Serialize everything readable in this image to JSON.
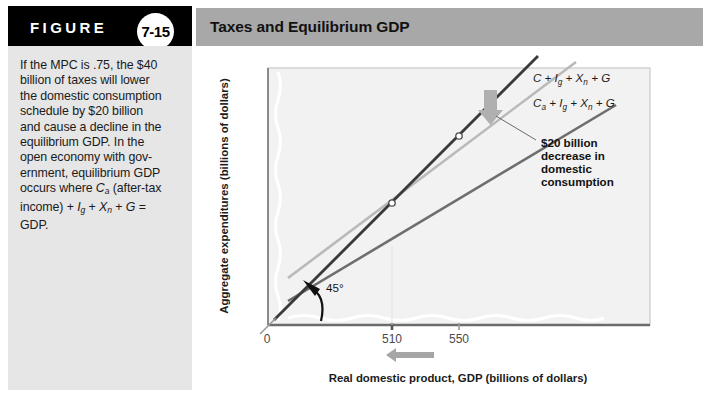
{
  "figure": {
    "word": "FIGURE",
    "number": "7-15",
    "title": "Taxes and Equilibrium GDP",
    "caption_lines": [
      "If the MPC is .75, the $40",
      "billion of taxes will lower",
      "the domestic consumption",
      "schedule by $20 billion",
      "and cause a decline in the",
      "equilibrium GDP. In the",
      "open economy with gov-",
      "ernment, equilibrium GDP",
      "occurs where Ca (after-tax",
      "income) + Ig + Xn + G =",
      "GDP."
    ]
  },
  "chart_data": {
    "type": "line",
    "title": "Taxes and Equilibrium GDP",
    "xlabel": "Real domestic product, GDP (billions of dollars)",
    "ylabel": "Aggregate expenditures (billions of dollars)",
    "xticks": [
      "0",
      "510",
      "550"
    ],
    "xtick_values": [
      0,
      510,
      550
    ],
    "xlim": [
      0,
      700
    ],
    "ylim": [
      0,
      700
    ],
    "grid": false,
    "legend_position": "inline-right",
    "series": [
      {
        "name": "45-degree-line",
        "label": "45°",
        "color": "#3d3d3d",
        "kind": "reference",
        "points": [
          [
            60,
            60
          ],
          [
            620,
            620
          ]
        ]
      },
      {
        "name": "C + Ig + Xn + G",
        "label_parts": [
          "C",
          " + ",
          "I",
          "g",
          " + ",
          "X",
          "n",
          " + ",
          "G"
        ],
        "label_plain": "C + Ig + Xn + G",
        "color": "#b5b5b5",
        "kind": "aggregate-expenditures-before-tax",
        "intercept": 192,
        "slope": 0.75,
        "equilibrium_gdp": 550
      },
      {
        "name": "Ca + Ig + Xn + G",
        "label_parts": [
          "C",
          "a",
          " + ",
          "I",
          "g",
          " + ",
          "X",
          "n",
          " + ",
          "G"
        ],
        "label_plain": "Ca + Ig + Xn + G",
        "color": "#6e6e6e",
        "kind": "aggregate-expenditures-after-tax",
        "intercept": 127,
        "slope": 0.75,
        "equilibrium_gdp": 510
      }
    ],
    "equilibrium_points": [
      {
        "name": "equilibrium-before-tax",
        "x": 550,
        "y": 550
      },
      {
        "name": "equilibrium-after-tax",
        "x": 510,
        "y": 510
      }
    ],
    "annotations": [
      {
        "name": "shift-annotation",
        "lines": [
          "$20 billion",
          "decrease in",
          "domestic",
          "consumption"
        ],
        "arrow": "down-block-arrow"
      },
      {
        "name": "angle-annotation",
        "text": "45°",
        "arrow": "curved-arrow"
      },
      {
        "name": "gdp-decrease-arrow",
        "direction": "left",
        "color": "#9a9a9a"
      }
    ]
  }
}
